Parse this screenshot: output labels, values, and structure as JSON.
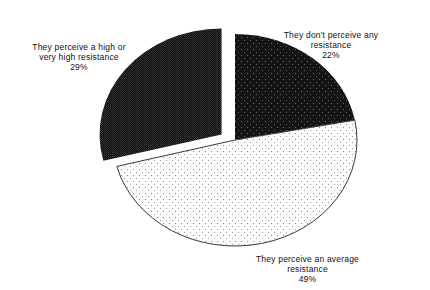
{
  "chart_data": {
    "type": "pie",
    "title": "",
    "start_angle_deg": 0,
    "direction": "clockwise",
    "slices": [
      {
        "label": "They don't perceive any resistance",
        "label_lines": [
          "They don't perceive any",
          "resistance"
        ],
        "value": 22,
        "value_text": "22%",
        "pattern": "dark-dotted",
        "exploded": false
      },
      {
        "label": "They perceive an average resistance",
        "label_lines": [
          "They perceive an average",
          "resistance"
        ],
        "value": 49,
        "value_text": "49%",
        "pattern": "light-dotted",
        "exploded": false
      },
      {
        "label": "They perceive a high or very high resistance",
        "label_lines": [
          "They perceive a high or",
          "very high resistance"
        ],
        "value": 29,
        "value_text": "29%",
        "pattern": "dark-checker",
        "exploded": true
      }
    ],
    "legend": "none (labels placed beside slices)",
    "colors": {
      "dark_fill": "#151515",
      "dark_dot": "#6a6a6a",
      "light_fill": "#fbfbfb",
      "light_dot": "#8c8c8c",
      "checker_a": "#0e0e0e",
      "checker_b": "#3c3c3c",
      "outline": "#3a3a3a"
    }
  }
}
